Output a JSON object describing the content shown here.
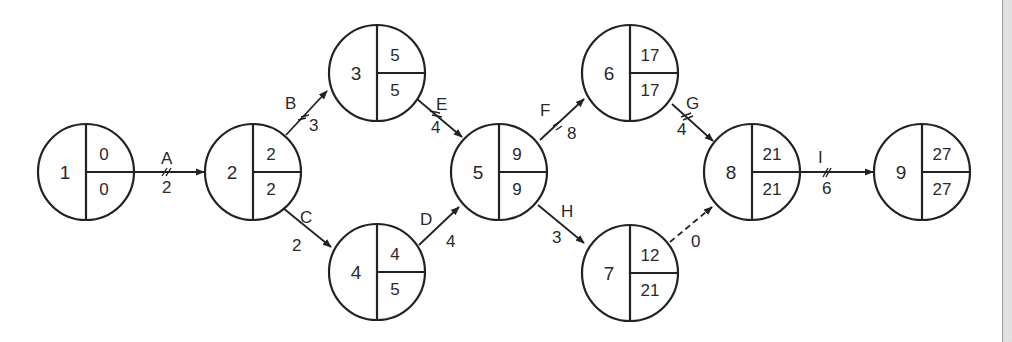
{
  "diagram": {
    "type": "activity-on-arrow network (critical path)",
    "nodes": [
      {
        "id": "1",
        "es": "0",
        "lf": "0",
        "cx": 86,
        "cy": 172
      },
      {
        "id": "2",
        "es": "2",
        "lf": "2",
        "cx": 253,
        "cy": 172
      },
      {
        "id": "3",
        "es": "5",
        "lf": "5",
        "cx": 377,
        "cy": 73
      },
      {
        "id": "4",
        "es": "4",
        "lf": "5",
        "cx": 377,
        "cy": 272
      },
      {
        "id": "5",
        "es": "9",
        "lf": "9",
        "cx": 499,
        "cy": 172
      },
      {
        "id": "6",
        "es": "17",
        "lf": "17",
        "cx": 663,
        "cy": 73
      },
      {
        "id": "7",
        "es": "12",
        "lf": "21",
        "cx": 630,
        "cy": 273
      },
      {
        "id": "8",
        "es": "21",
        "lf": "21",
        "cx": 752,
        "cy": 172
      },
      {
        "id": "9",
        "es": "27",
        "lf": "27",
        "cx": 922,
        "cy": 172
      }
    ],
    "activities": [
      {
        "name": "A",
        "from": "1",
        "to": "2",
        "duration": "2",
        "critical": true,
        "dummy": false
      },
      {
        "name": "B",
        "from": "2",
        "to": "3",
        "duration": "3",
        "critical": true,
        "dummy": false
      },
      {
        "name": "C",
        "from": "2",
        "to": "4",
        "duration": "2",
        "critical": false,
        "dummy": false
      },
      {
        "name": "D",
        "from": "4",
        "to": "5",
        "duration": "4",
        "critical": false,
        "dummy": false
      },
      {
        "name": "E",
        "from": "3",
        "to": "5",
        "duration": "4",
        "critical": true,
        "dummy": false
      },
      {
        "name": "F",
        "from": "5",
        "to": "6",
        "duration": "8",
        "critical": true,
        "dummy": false
      },
      {
        "name": "G",
        "from": "6",
        "to": "8",
        "duration": "4",
        "critical": true,
        "dummy": false
      },
      {
        "name": "H",
        "from": "5",
        "to": "7",
        "duration": "3",
        "critical": false,
        "dummy": false
      },
      {
        "name": "",
        "from": "7",
        "to": "8",
        "duration": "0",
        "critical": false,
        "dummy": true
      },
      {
        "name": "I",
        "from": "8",
        "to": "9",
        "duration": "6",
        "critical": true,
        "dummy": false
      }
    ]
  },
  "colors": {
    "line": "#222222",
    "text": "#2a2a2a",
    "background": "#ffffff",
    "edge_strip": "#d6d6d6"
  }
}
